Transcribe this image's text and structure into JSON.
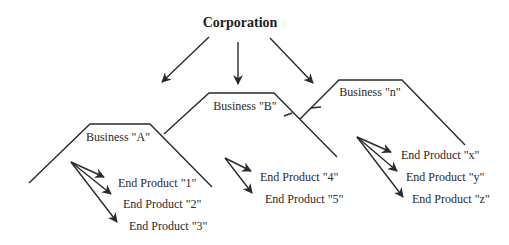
{
  "root": {
    "label": "Corporation"
  },
  "businesses": [
    {
      "label": "Business \"A\"",
      "products": [
        "End Product \"1\"",
        "End Product \"2\"",
        "End Product \"3\""
      ]
    },
    {
      "label": "Business \"B\"",
      "products": [
        "End Product \"4\"",
        "End Product \"5\""
      ]
    },
    {
      "label": "Business \"n\"",
      "products": [
        "End Product \"x\"",
        "End Product \"y\"",
        "End Product \"z\""
      ]
    }
  ]
}
